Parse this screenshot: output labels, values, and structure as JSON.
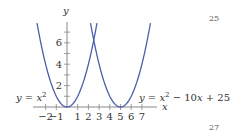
{
  "chart_data": {
    "type": "line",
    "title": "",
    "xlabel": "x",
    "ylabel": "y",
    "xlim": [
      -3.2,
      8.4
    ],
    "ylim": [
      0,
      7.9
    ],
    "x_ticks": [
      -2,
      -1,
      1,
      2,
      3,
      4,
      5,
      6,
      7
    ],
    "x_tick_labels": [
      "−2",
      "−1",
      "1",
      "2",
      "3",
      "4",
      "5",
      "6",
      "7"
    ],
    "y_ticks": [
      1,
      2,
      3,
      4,
      5,
      6,
      7
    ],
    "y_tick_labels": [
      "2",
      "4",
      "6"
    ],
    "y_labeled_ticks": [
      2,
      4,
      6
    ],
    "grid": false,
    "series": [
      {
        "name": "y = x^2",
        "label": "y = x²",
        "expr": "x^2",
        "x_range": [
          -2.8,
          2.8
        ],
        "color": "#4a5fa8"
      },
      {
        "name": "y = x^2 - 10x + 25",
        "label": "y = x² − 10x + 25",
        "expr": "x^2 - 10x + 25",
        "x_range": [
          2.2,
          7.8
        ],
        "color": "#4a5fa8"
      }
    ],
    "annotations": [
      {
        "text": "y = x²",
        "near": "left parabola, at y≈0.5 left of y-axis"
      },
      {
        "text": "y = x² − 10x + 25",
        "near": "right parabola, right side above x-axis"
      }
    ]
  },
  "labels": {
    "y_axis": "y",
    "x_axis": "x",
    "left_eq_y": "y",
    "left_eq_eq": " = ",
    "left_eq_x": "x",
    "left_eq_exp": "2",
    "right_eq_y": "y",
    "right_eq_eq": " = ",
    "right_eq_x": "x",
    "right_eq_exp": "2",
    "right_eq_rest1": " − 10",
    "right_eq_x2": "x",
    "right_eq_rest2": " + 25"
  },
  "page_numbers": {
    "top": "25",
    "bottom": "27"
  }
}
